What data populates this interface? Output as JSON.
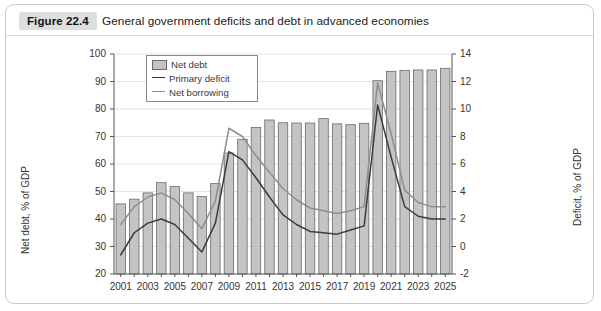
{
  "figure": {
    "tag": "Figure 22.4",
    "caption": "General government deficits and debt in advanced economies"
  },
  "chart_data": {
    "type": "bar",
    "title": "General government deficits and debt in advanced economies",
    "xlabel": "",
    "ylabel": "Net debt, % of GDP",
    "y2label": "Deficit, % of GDP",
    "ylim": [
      20,
      100
    ],
    "y2lim": [
      -2,
      14
    ],
    "yticks": [
      20,
      30,
      40,
      50,
      60,
      70,
      80,
      90,
      100
    ],
    "y2ticks": [
      -2,
      0,
      2,
      4,
      6,
      8,
      10,
      12,
      14
    ],
    "grid": true,
    "legend_position": "top-left",
    "x": [
      2001,
      2002,
      2003,
      2004,
      2005,
      2006,
      2007,
      2008,
      2009,
      2010,
      2011,
      2012,
      2013,
      2014,
      2015,
      2016,
      2017,
      2018,
      2019,
      2020,
      2021,
      2022,
      2023,
      2024,
      2025
    ],
    "xtick_labels": [
      "2001",
      "2003",
      "2005",
      "2007",
      "2009",
      "2011",
      "2013",
      "2015",
      "2017",
      "2019",
      "2021",
      "2023",
      "2025"
    ],
    "series": [
      {
        "name": "Net debt",
        "kind": "bar",
        "axis": "left",
        "color": "#c4c4c4",
        "edge_color": "#6b6b6b",
        "values": [
          45.5,
          47.2,
          49.5,
          53.2,
          51.8,
          49.5,
          48.2,
          52.9,
          64.0,
          69.0,
          73.3,
          76.0,
          75.0,
          74.9,
          74.9,
          76.5,
          74.6,
          74.3,
          74.8,
          90.3,
          93.7,
          94.0,
          94.2,
          94.2,
          94.8
        ]
      },
      {
        "name": "Primary deficit",
        "kind": "line",
        "axis": "right",
        "color": "#3b3b3b",
        "values": [
          -0.6,
          1.0,
          1.7,
          2.0,
          1.6,
          0.6,
          -0.4,
          1.7,
          6.9,
          6.3,
          5.0,
          3.6,
          2.3,
          1.6,
          1.1,
          1.0,
          0.9,
          1.2,
          1.5,
          10.3,
          6.5,
          2.9,
          2.2,
          2.0,
          2.0
        ]
      },
      {
        "name": "Net borrowing",
        "kind": "line",
        "axis": "right",
        "color": "#8e8e8e",
        "values": [
          1.6,
          2.9,
          3.6,
          3.9,
          3.4,
          2.4,
          1.3,
          3.3,
          8.6,
          8.0,
          6.6,
          5.4,
          4.2,
          3.4,
          2.8,
          2.6,
          2.4,
          2.6,
          2.9,
          11.9,
          8.2,
          4.1,
          3.2,
          2.9,
          2.9
        ]
      }
    ]
  },
  "axes": {
    "left_title": "Net debt, % of GDP",
    "right_title": "Deficit, % of GDP"
  },
  "legend": {
    "items": [
      {
        "label": "Net debt",
        "swatch": "bar-swatch"
      },
      {
        "label": "Primary deficit",
        "swatch": "line-swatch"
      },
      {
        "label": "Net borrowing",
        "swatch": "line-swatch"
      }
    ]
  }
}
